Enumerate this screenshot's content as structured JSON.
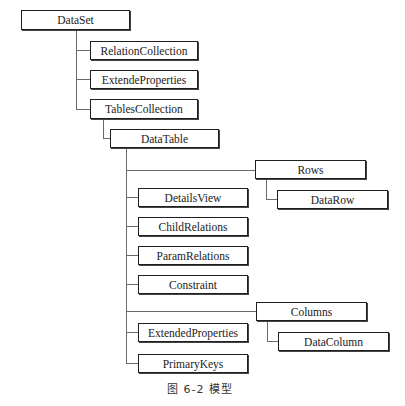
{
  "diagram": {
    "type": "tree",
    "nodes": {
      "dataset": "DataSet",
      "relation_collection": "RelationCollection",
      "extende_properties": "ExtendeProperties",
      "tables_collection": "TablesCollection",
      "data_table": "DataTable",
      "rows": "Rows",
      "data_row": "DataRow",
      "details_view": "DetailsView",
      "child_relations": "ChildRelations",
      "param_relations": "ParamRelations",
      "constraint": "Constraint",
      "columns": "Columns",
      "data_column": "DataColumn",
      "extended_properties": "ExtendedProperties",
      "primary_keys": "PrimaryKeys"
    },
    "edges": [
      [
        "DataSet",
        "RelationCollection"
      ],
      [
        "DataSet",
        "ExtendeProperties"
      ],
      [
        "DataSet",
        "TablesCollection"
      ],
      [
        "TablesCollection",
        "DataTable"
      ],
      [
        "DataTable",
        "Rows"
      ],
      [
        "Rows",
        "DataRow"
      ],
      [
        "DataTable",
        "DetailsView"
      ],
      [
        "DataTable",
        "ChildRelations"
      ],
      [
        "DataTable",
        "ParamRelations"
      ],
      [
        "DataTable",
        "Constraint"
      ],
      [
        "DataTable",
        "Columns"
      ],
      [
        "Columns",
        "DataColumn"
      ],
      [
        "DataTable",
        "ExtendedProperties"
      ],
      [
        "DataTable",
        "PrimaryKeys"
      ]
    ],
    "caption": "图 6-2  模型"
  }
}
